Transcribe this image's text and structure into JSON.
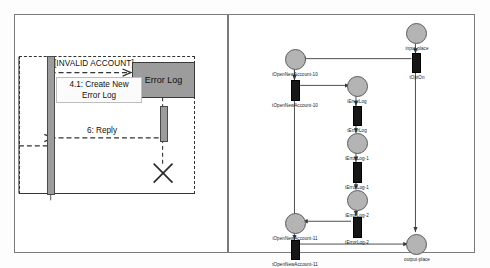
{
  "page": {
    "background_color": "#fdfdfd",
    "panel_border_color": "#7a7a7a"
  },
  "left_panel": {
    "name": "uml-sequence-diagram",
    "fragment_guard": "[INVALID ACCOUNT]",
    "object_box_label": "Error Log",
    "messages": [
      {
        "id": "create-new-error-log",
        "label_line1": "4.1: Create New",
        "label_line2": "Error Log",
        "style": "dashed",
        "direction": "right"
      },
      {
        "id": "reply",
        "label_line1": "6: Reply",
        "label_line2": "",
        "style": "dashed",
        "direction": "left"
      }
    ],
    "destruction_marker": "X",
    "colors": {
      "activation_fill": "#9c9c9c",
      "object_fill": "#9c9c9c",
      "line": "#333333"
    }
  },
  "right_panel": {
    "name": "petri-net-diagram",
    "places": [
      {
        "id": "input-place",
        "label": "input-place"
      },
      {
        "id": "iOpenNewAccount-10",
        "label": "iOpenNewAccount-10"
      },
      {
        "id": "iErrorLog",
        "label": "iErrorLog"
      },
      {
        "id": "iErrorLog-1",
        "label": "iErrorLog-1"
      },
      {
        "id": "iErrorLog-2",
        "label": "iErrorLog-2"
      },
      {
        "id": "iOpenNewAccount-11",
        "label": "iOpenNewAccount-11"
      },
      {
        "id": "output-place",
        "label": "output-place"
      }
    ],
    "transitions": [
      {
        "id": "tOptOn",
        "label": "tOptOn"
      },
      {
        "id": "tOpenNewAccount-10",
        "label": "tOpenNewAccount-10"
      },
      {
        "id": "tErrorLog",
        "label": "tErrorLog"
      },
      {
        "id": "tErrorLog-1",
        "label": "tErrorLog-1"
      },
      {
        "id": "tErrorLog-2",
        "label": "tErrorLog-2"
      },
      {
        "id": "tOpenNewAccount-11",
        "label": "tOpenNewAccount-11"
      }
    ],
    "colors": {
      "place_fill": "#b4b4b4",
      "transition_fill": "#161616",
      "arc": "#3a3a3a"
    }
  }
}
